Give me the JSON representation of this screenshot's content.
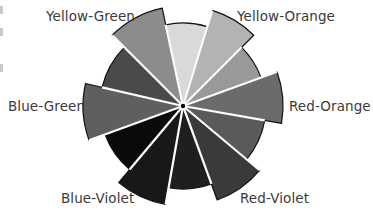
{
  "diagram": {
    "title": "",
    "center": [
      183,
      106
    ],
    "base_radius": 83,
    "extended_radius": 100,
    "segments": [
      {
        "name": "Yellow",
        "start": -12,
        "end": 17,
        "extended": false,
        "fill": "#d9d9d9"
      },
      {
        "name": "Yellow-Orange",
        "start": 17,
        "end": 45,
        "extended": true,
        "fill": "#b3b3b3"
      },
      {
        "name": "Orange",
        "start": 45,
        "end": 70,
        "extended": false,
        "fill": "#999999"
      },
      {
        "name": "Red-Orange",
        "start": 70,
        "end": 100,
        "extended": true,
        "fill": "#6b6b6b"
      },
      {
        "name": "Red",
        "start": 100,
        "end": 130,
        "extended": false,
        "fill": "#5a5a5a"
      },
      {
        "name": "Red-Violet",
        "start": 130,
        "end": 160,
        "extended": true,
        "fill": "#3a3a3a"
      },
      {
        "name": "Violet",
        "start": 160,
        "end": 190,
        "extended": false,
        "fill": "#1f1f1f"
      },
      {
        "name": "Blue-Violet",
        "start": 190,
        "end": 220,
        "extended": true,
        "fill": "#181818"
      },
      {
        "name": "Blue",
        "start": 220,
        "end": 250,
        "extended": false,
        "fill": "#0a0a0a"
      },
      {
        "name": "Blue-Green",
        "start": 250,
        "end": 283,
        "extended": true,
        "fill": "#5f5f5f"
      },
      {
        "name": "Green",
        "start": 283,
        "end": 315,
        "extended": false,
        "fill": "#4a4a4a"
      },
      {
        "name": "Yellow-Green",
        "start": 315,
        "end": 348,
        "extended": true,
        "fill": "#8c8c8c"
      }
    ],
    "labels": {
      "yellow_green": "Yellow-Green",
      "yellow_orange": "Yellow-Orange",
      "red_orange": "Red-Orange",
      "red_violet": "Red-Violet",
      "blue_violet": "Blue-Violet",
      "blue_green": "Blue-Green"
    },
    "colors": {
      "outline": "#111111",
      "separator": "#ffffff",
      "label_text": "#3a3a3a"
    }
  }
}
